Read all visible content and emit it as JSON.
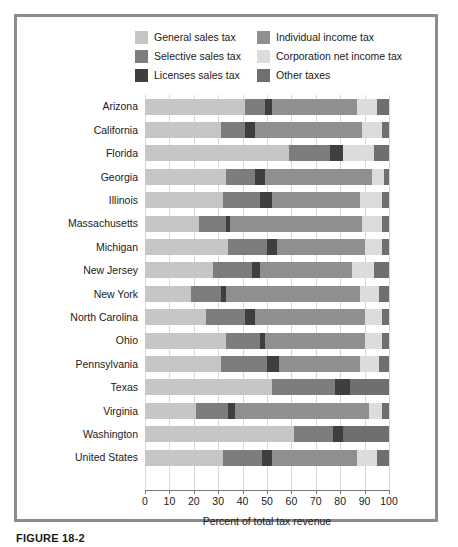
{
  "caption": "FIGURE 18-2",
  "legend": {
    "items": [
      {
        "label": "General sales tax",
        "color": "#c6c6c6",
        "key": "general_sales"
      },
      {
        "label": "Individual income tax",
        "color": "#8f8f8f",
        "key": "individual_income"
      },
      {
        "label": "Selective sales tax",
        "color": "#7d7d7d",
        "key": "selective_sales"
      },
      {
        "label": "Corporation net income tax",
        "color": "#dcdcdc",
        "key": "corporation_net_income"
      },
      {
        "label": "Licenses sales tax",
        "color": "#3f3f3f",
        "key": "licenses_sales"
      },
      {
        "label": "Other taxes",
        "color": "#6f6f6f",
        "key": "other_taxes"
      }
    ]
  },
  "chart_data": {
    "type": "bar",
    "orientation": "horizontal",
    "stacked": true,
    "title": "",
    "xlabel": "Percent of total tax revenue",
    "ylabel": "",
    "xlim": [
      0,
      100
    ],
    "xticks": [
      0,
      10,
      20,
      30,
      40,
      50,
      60,
      70,
      80,
      90,
      100
    ],
    "grid": true,
    "legend_position": "top",
    "categories": [
      "Arizona",
      "California",
      "Florida",
      "Georgia",
      "Illinois",
      "Massachusetts",
      "Michigan",
      "New Jersey",
      "New York",
      "North Carolina",
      "Ohio",
      "Pennsylvania",
      "Texas",
      "Virginia",
      "Washington",
      "United States"
    ],
    "series": [
      {
        "name": "General sales tax",
        "color": "#c6c6c6",
        "values": [
          41,
          31,
          59,
          33,
          32,
          22,
          34,
          28,
          19,
          25,
          33,
          31,
          52,
          21,
          61,
          32
        ]
      },
      {
        "name": "Selective sales tax",
        "color": "#7d7d7d",
        "values": [
          8,
          10,
          17,
          12,
          15,
          11,
          16,
          16,
          12,
          16,
          14,
          19,
          26,
          13,
          16,
          16
        ]
      },
      {
        "name": "Licenses sales tax",
        "color": "#3f3f3f",
        "values": [
          3,
          4,
          5,
          4,
          5,
          2,
          4,
          3,
          2,
          4,
          2,
          5,
          6,
          3,
          4,
          4
        ]
      },
      {
        "name": "Individual income tax",
        "color": "#8f8f8f",
        "values": [
          35,
          44,
          0,
          44,
          36,
          54,
          36,
          38,
          55,
          45,
          41,
          33,
          0,
          55,
          0,
          35
        ]
      },
      {
        "name": "Corporation net income tax",
        "color": "#dcdcdc",
        "values": [
          8,
          8,
          13,
          5,
          9,
          8,
          7,
          9,
          8,
          7,
          7,
          8,
          0,
          5,
          0,
          8
        ]
      },
      {
        "name": "Other taxes",
        "color": "#6f6f6f",
        "values": [
          5,
          3,
          6,
          2,
          3,
          3,
          3,
          6,
          4,
          3,
          3,
          4,
          16,
          3,
          19,
          5
        ]
      }
    ]
  }
}
